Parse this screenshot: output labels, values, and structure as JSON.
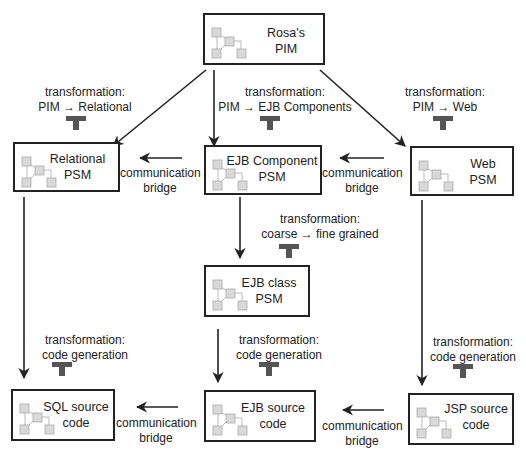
{
  "diagram": {
    "nodes": {
      "pim": {
        "line1": "Rosa's",
        "line2": "PIM"
      },
      "relational_psm": {
        "line1": "Relational",
        "line2": "PSM"
      },
      "ejb_component_psm": {
        "line1": "EJB Component",
        "line2": "PSM"
      },
      "web_psm": {
        "line1": "Web",
        "line2": "PSM"
      },
      "ejb_class_psm": {
        "line1": "EJB class",
        "line2": "PSM"
      },
      "sql_source": {
        "line1": "SQL source",
        "line2": "code"
      },
      "ejb_source": {
        "line1": "EJB source",
        "line2": "code"
      },
      "jsp_source": {
        "line1": "JSP source",
        "line2": "code"
      }
    },
    "transformations": {
      "pim_relational": {
        "line1": "transformation:",
        "line2": "PIM → Relational"
      },
      "pim_ejb": {
        "line1": "transformation:",
        "line2": "PIM → EJB Components"
      },
      "pim_web": {
        "line1": "transformation:",
        "line2": "PIM → Web"
      },
      "coarse_fine": {
        "line1": "transformation:",
        "line2": "coarse → fine grained"
      },
      "codegen_sql": {
        "line1": "transformation:",
        "line2": "code generation"
      },
      "codegen_ejb": {
        "line1": "transformation:",
        "line2": "code generation"
      },
      "codegen_jsp": {
        "line1": "transformation:",
        "line2": "code generation"
      }
    },
    "bridges": {
      "ejb_to_relational": {
        "line1": "communication",
        "line2": "bridge"
      },
      "web_to_ejb": {
        "line1": "communication",
        "line2": "bridge"
      },
      "ejb_to_sql": {
        "line1": "communication",
        "line2": "bridge"
      },
      "jsp_to_ejb": {
        "line1": "communication",
        "line2": "bridge"
      }
    },
    "colors": {
      "line": "#222222",
      "tee": "#555555",
      "mini_fill": "#d9d9d9",
      "mini_stroke": "#aaaaaa"
    }
  }
}
